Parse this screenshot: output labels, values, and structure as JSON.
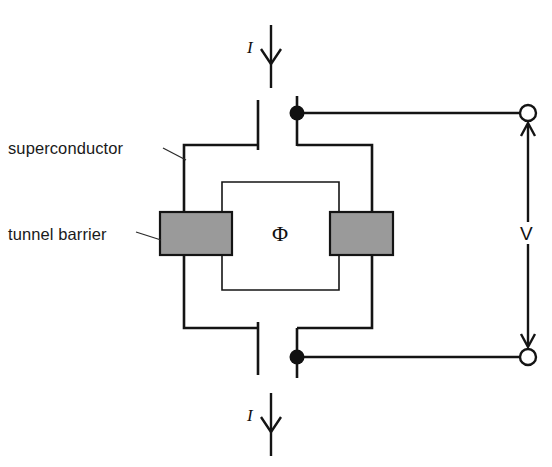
{
  "figure": {
    "background_color": "#ffffff",
    "line_color": "#141414",
    "barrier_fill_color": "#9a9a9a",
    "width": 552,
    "height": 467
  },
  "labels": {
    "superconductor": "superconductor",
    "tunnel_barrier": "tunnel barrier",
    "flux_symbol": "Φ",
    "current_top": "I",
    "current_bottom": "I",
    "voltage": "V"
  },
  "elements": {
    "barrier_left_name": "tunnel-barrier-left",
    "barrier_right_name": "tunnel-barrier-right",
    "node_top_name": "junction-node-top",
    "node_bottom_name": "junction-node-bottom",
    "terminal_top_name": "voltage-terminal-top",
    "terminal_bottom_name": "voltage-terminal-bottom"
  }
}
